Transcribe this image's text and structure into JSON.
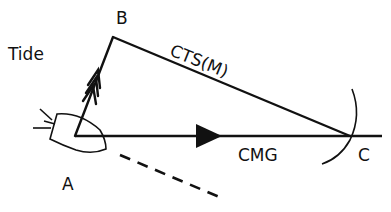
{
  "diagram": {
    "labels": {
      "tide": "Tide",
      "point_a": "A",
      "point_b": "B",
      "point_c": "C",
      "cts": "CTS(M)",
      "cmg": "CMG"
    },
    "points": {
      "A": [
        75,
        136
      ],
      "B": [
        113,
        37
      ],
      "C": [
        350,
        136
      ]
    },
    "colors": {
      "ink": "#111111",
      "background": "#ffffff"
    }
  }
}
